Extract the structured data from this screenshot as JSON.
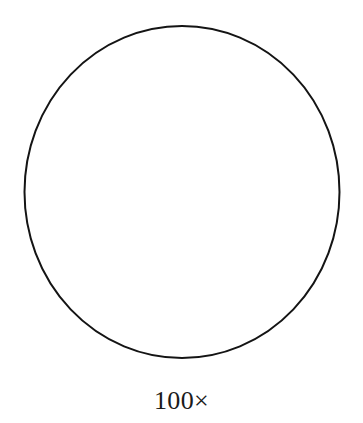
{
  "figure": {
    "background_color": "#ffffff",
    "caption": "100×",
    "shape": {
      "kind": "circle-outline",
      "stroke_color": "#141414",
      "fill_color": "#ffffff",
      "stroke_width_px": 2,
      "center_x_px": 182,
      "center_y_px": 192,
      "width_px": 317,
      "height_px": 334
    }
  },
  "chart_data": {
    "type": "scatter",
    "title": "",
    "subtitle": "",
    "xlabel": "",
    "ylabel": "",
    "annotations": [
      {
        "text": "100×",
        "role": "magnification-label",
        "x_px": 182,
        "y_px": 405
      }
    ],
    "shapes": [
      {
        "type": "ellipse",
        "label": "field-of-view-circle",
        "cx_px": 182,
        "cy_px": 192,
        "rx_px": 158.5,
        "ry_px": 167,
        "stroke": "#141414",
        "stroke_width": 2,
        "fill": "none"
      }
    ],
    "grid": false,
    "legend": false
  }
}
